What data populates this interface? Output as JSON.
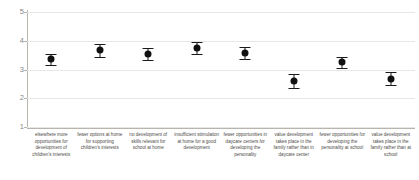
{
  "chart_data": {
    "type": "scatter",
    "title": "",
    "subtitle": "",
    "xlabel": "",
    "ylabel": "",
    "ylim": [
      1,
      5
    ],
    "yticks": [
      1,
      2,
      3,
      4,
      5
    ],
    "ytick_labels": [
      "1",
      "2",
      "3",
      "4",
      "5"
    ],
    "grid": true,
    "legend": "none",
    "marker": "filled-circle",
    "error_bars": "symmetric",
    "categories": [
      "elsewhere more opportunities for development of children's interests",
      "fewer options at home for supporting children's interests",
      "no development of skills relevant for school at home",
      "insufficient stimulation at home for a good development",
      "fewer opportunities in daycare centers for developing the personality",
      "value development takes place in the family rather than in daycare center",
      "fewer opportunities for developing the personality at school",
      "value development takes place in the family rather than at school"
    ],
    "values": [
      3.35,
      3.67,
      3.54,
      3.76,
      3.57,
      2.59,
      3.25,
      2.68
    ],
    "errors": [
      0.2,
      0.22,
      0.2,
      0.21,
      0.21,
      0.24,
      0.2,
      0.22
    ],
    "series": [
      {
        "name": "mean",
        "values": [
          3.35,
          3.67,
          3.54,
          3.76,
          3.57,
          2.59,
          3.25,
          2.68
        ],
        "errors": [
          0.2,
          0.22,
          0.2,
          0.21,
          0.21,
          0.24,
          0.2,
          0.22
        ]
      }
    ],
    "colors": {
      "marker": "#111111",
      "errorbar": "#1a1a1a",
      "gridline": "#e9e7e2",
      "axis": "#b8b5ae",
      "tick_text": "#8a8782",
      "label_text": "#4d4b47",
      "background": "#ffffff"
    }
  }
}
